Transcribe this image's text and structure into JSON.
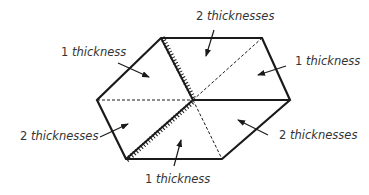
{
  "diagram": {
    "colors": {
      "line": "#1a1a1a",
      "text": "#333333",
      "background": "#ffffff"
    },
    "labels": [
      {
        "id": "label-top-left",
        "num": "1",
        "word": "thickness"
      },
      {
        "id": "label-top",
        "num": "2",
        "word": "thicknesses"
      },
      {
        "id": "label-right",
        "num": "1",
        "word": "thickness"
      },
      {
        "id": "label-left",
        "num": "2",
        "word": "thicknesses"
      },
      {
        "id": "label-bottom-right",
        "num": "2",
        "word": "thicknesses"
      },
      {
        "id": "label-bottom",
        "num": "1",
        "word": "thickness"
      }
    ],
    "legend": {
      "solid_line": "outer edge",
      "dashed_line": "fold line",
      "hatched_line": "cut/raw edge"
    }
  }
}
